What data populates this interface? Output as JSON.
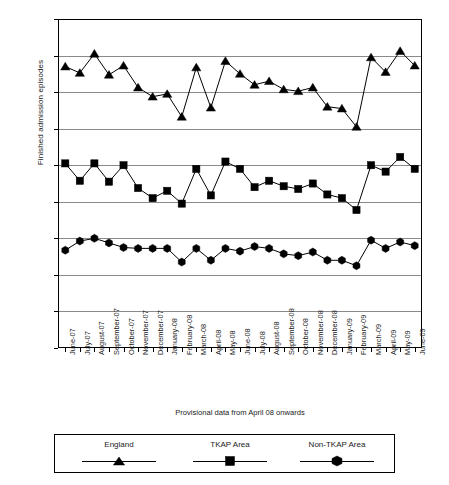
{
  "chart_data": {
    "type": "line",
    "title": "",
    "xlabel": "Provisional data from April 08 onwards",
    "ylabel": "Finished admission episodes",
    "ylim": [
      0,
      1800
    ],
    "ytick_step": 200,
    "yticks": [
      0,
      200,
      400,
      600,
      800,
      1000,
      1200,
      1400,
      1600,
      1800
    ],
    "grid": true,
    "legend_position": "bottom",
    "categories": [
      "June-07",
      "July-07",
      "August-07",
      "September-07",
      "October-07",
      "November-07",
      "December-07",
      "January-08",
      "February-08",
      "March-08",
      "April-08",
      "May-08",
      "June-08",
      "July-08",
      "August-08",
      "September-08",
      "October-08",
      "November-08",
      "December-08",
      "January-09",
      "February-09",
      "March-09",
      "April-09",
      "May-09",
      "June-09"
    ],
    "series": [
      {
        "name": "England",
        "marker": "triangle",
        "color": "#000000",
        "values": [
          1540,
          1505,
          1610,
          1495,
          1545,
          1425,
          1375,
          1390,
          1265,
          1535,
          1315,
          1570,
          1500,
          1440,
          1460,
          1415,
          1405,
          1425,
          1320,
          1310,
          1210,
          1590,
          1510,
          1625,
          1545
        ]
      },
      {
        "name": "TKAP Area",
        "marker": "square",
        "color": "#000000",
        "values": [
          1010,
          915,
          1010,
          910,
          1000,
          875,
          820,
          860,
          790,
          980,
          835,
          1020,
          980,
          880,
          915,
          885,
          870,
          900,
          840,
          820,
          755,
          1000,
          965,
          1045,
          980
        ]
      },
      {
        "name": "Non-TKAP Area",
        "marker": "hexagon",
        "color": "#000000",
        "values": [
          535,
          585,
          600,
          575,
          550,
          545,
          545,
          545,
          470,
          545,
          480,
          545,
          530,
          555,
          545,
          515,
          505,
          525,
          480,
          480,
          450,
          590,
          545,
          580,
          560
        ]
      }
    ]
  },
  "legend": {
    "items": [
      {
        "label": "England",
        "marker": "triangle"
      },
      {
        "label": "TKAP Area",
        "marker": "square"
      },
      {
        "label": "Non-TKAP Area",
        "marker": "hexagon"
      }
    ]
  }
}
